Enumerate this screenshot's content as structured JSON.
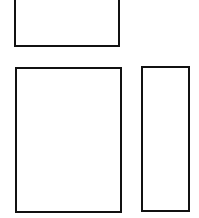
{
  "diagram": {
    "background": "#ffffff",
    "stroke_color": "#111111",
    "boxes": [
      {
        "id": "top",
        "label": ""
      },
      {
        "id": "bottom-left",
        "label": ""
      },
      {
        "id": "bottom-right",
        "label": ""
      }
    ]
  }
}
